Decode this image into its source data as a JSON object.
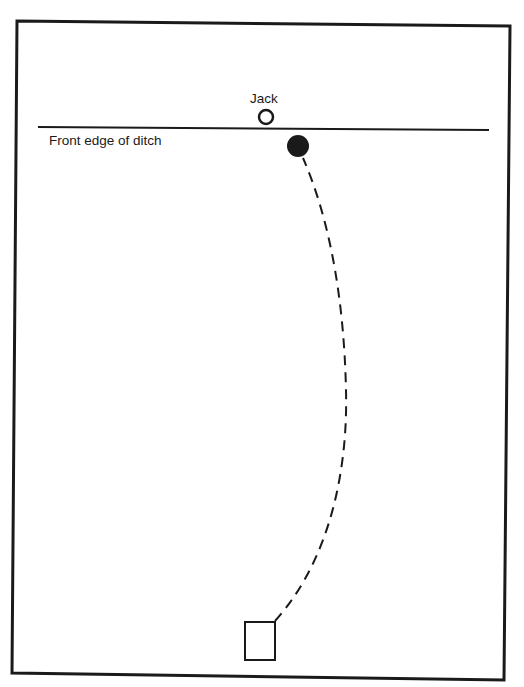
{
  "diagram": {
    "labels": {
      "jack": "Jack",
      "ditch": "Front edge of ditch"
    },
    "colors": {
      "ink": "#1a1a1a",
      "paper": "#ffffff"
    },
    "elements": {
      "frame": {
        "shape": "quadrilateral",
        "corners": [
          [
            17,
            21
          ],
          [
            510,
            26
          ],
          [
            504,
            680
          ],
          [
            12,
            673
          ]
        ]
      },
      "ditch_line": {
        "x1": 38,
        "y1": 127,
        "x2": 489,
        "y2": 130
      },
      "jack": {
        "cx": 266,
        "cy": 117,
        "r": 7,
        "filled": false
      },
      "bowl": {
        "cx": 298,
        "cy": 146,
        "r": 11,
        "filled": true
      },
      "mat": {
        "x": 245,
        "y": 622,
        "width": 30,
        "height": 38
      },
      "delivery_path": {
        "style": "dashed",
        "points": [
          [
            275,
            621
          ],
          [
            345,
            390
          ],
          [
            303,
            158
          ]
        ]
      }
    }
  }
}
